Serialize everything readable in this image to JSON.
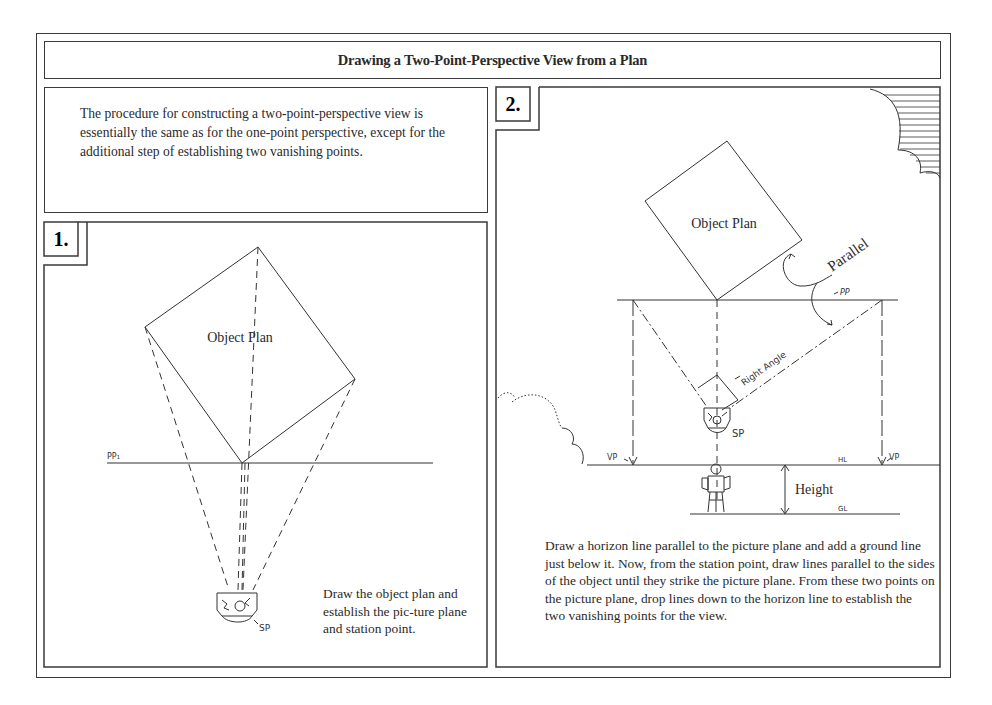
{
  "page": {
    "title": "Drawing a Two-Point-Perspective View from a Plan",
    "intro": "The procedure for constructing a two-point-perspective view is essentially the same as for the one-point perspective, except for the additional step of establishing two vanishing points."
  },
  "panels": [
    {
      "number": "1.",
      "diagram": {
        "object_label": "Object Plan",
        "picture_plane_label": "PP₁",
        "station_point_label": "SP"
      },
      "caption": "Draw the object plan and establish the pic-ture plane and station point."
    },
    {
      "number": "2.",
      "diagram": {
        "object_label": "Object Plan",
        "parallel_label": "Parallel",
        "picture_plane_label": "PP",
        "right_angle_label": "Right Angle",
        "station_point_label": "SP",
        "vanishing_point_left_label": "VP",
        "vanishing_point_right_label": "VP",
        "horizon_line_label": "HL",
        "ground_line_label": "GL",
        "height_label": "Height"
      },
      "caption": "Draw a horizon line parallel to the picture plane and add a ground line just below it. Now, from the station point, draw lines parallel to the sides of the object until they strike the picture plane. From these two points on the picture plane, drop lines down to the horizon line to establish the two vanishing points for the view."
    }
  ],
  "colors": {
    "ink": "#2a2a2a",
    "paper": "#ffffff"
  }
}
